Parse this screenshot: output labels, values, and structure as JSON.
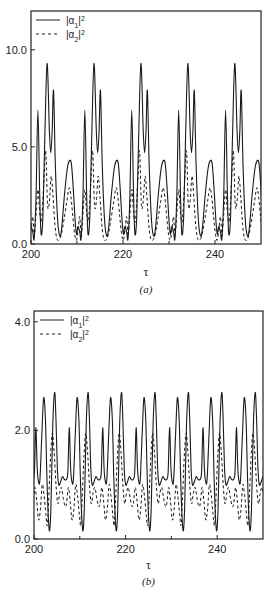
{
  "chart_data": [
    {
      "type": "line",
      "panel_label": "(a)",
      "title": "",
      "xlabel": "τ",
      "ylabel": "",
      "xlim": [
        200,
        250
      ],
      "ylim": [
        0,
        12
      ],
      "xticks": [
        200,
        220,
        240
      ],
      "xtick_labels": [
        "200",
        "220",
        "240"
      ],
      "xminor_ticks": [
        210,
        230
      ],
      "yticks": [
        0,
        5,
        10
      ],
      "ytick_labels": [
        "0.0",
        "5.0",
        "10.0"
      ],
      "grid": false,
      "legend": {
        "placement": "top-left",
        "entries": [
          {
            "label_base": "|α",
            "label_sub": "1",
            "label_post": "|",
            "label_sup": "2",
            "style": "solid"
          },
          {
            "label_base": "|α",
            "label_sub": "2",
            "label_post": "|",
            "label_sup": "2",
            "style": "dashed"
          }
        ]
      },
      "period": 10.2,
      "series": [
        {
          "name": "|α1|^2",
          "style": "solid",
          "period_template": [
            [
              0.0,
              0.6
            ],
            [
              0.3,
              0.3
            ],
            [
              0.7,
              2.5
            ],
            [
              1.1,
              6.9
            ],
            [
              1.5,
              2.5
            ],
            [
              1.8,
              0.5
            ],
            [
              2.2,
              1.5
            ],
            [
              2.6,
              5.5
            ],
            [
              3.1,
              9.3
            ],
            [
              3.6,
              5.8
            ],
            [
              3.9,
              4.7
            ],
            [
              4.2,
              5.8
            ],
            [
              4.5,
              7.9
            ],
            [
              4.9,
              4.0
            ],
            [
              5.4,
              1.2
            ],
            [
              5.9,
              0.4
            ],
            [
              6.3,
              0.9
            ],
            [
              6.9,
              2.6
            ],
            [
              7.5,
              3.9
            ],
            [
              8.0,
              4.3
            ],
            [
              8.4,
              4.1
            ],
            [
              8.8,
              2.8
            ],
            [
              9.2,
              1.2
            ],
            [
              9.5,
              0.5
            ],
            [
              9.8,
              0.9
            ],
            [
              10.2,
              0.6
            ]
          ],
          "phase_start": 200.4
        },
        {
          "name": "|α2|^2",
          "style": "dashed",
          "period_template": [
            [
              0.0,
              1.4
            ],
            [
              0.3,
              0.4
            ],
            [
              0.6,
              1.2
            ],
            [
              1.1,
              2.8
            ],
            [
              1.5,
              1.6
            ],
            [
              1.9,
              1.2
            ],
            [
              2.4,
              3.2
            ],
            [
              2.8,
              4.8
            ],
            [
              3.2,
              2.0
            ],
            [
              3.6,
              2.2
            ],
            [
              4.0,
              3.5
            ],
            [
              4.4,
              2.4
            ],
            [
              4.8,
              1.0
            ],
            [
              5.2,
              0.3
            ],
            [
              5.7,
              0.2
            ],
            [
              6.2,
              0.5
            ],
            [
              6.8,
              1.3
            ],
            [
              7.4,
              2.2
            ],
            [
              7.9,
              2.9
            ],
            [
              8.3,
              2.4
            ],
            [
              8.7,
              1.4
            ],
            [
              9.1,
              0.5
            ],
            [
              9.5,
              0.2
            ],
            [
              9.9,
              0.9
            ],
            [
              10.2,
              1.4
            ]
          ],
          "phase_start": 200.4
        }
      ]
    },
    {
      "type": "line",
      "panel_label": "(b)",
      "title": "",
      "xlabel": "τ",
      "ylabel": "",
      "xlim": [
        200,
        250
      ],
      "ylim": [
        0,
        4.2
      ],
      "xticks": [
        200,
        220,
        240
      ],
      "xtick_labels": [
        "200",
        "220",
        "240"
      ],
      "xminor_ticks": [
        210,
        230
      ],
      "yticks": [
        0,
        2,
        4
      ],
      "ytick_labels": [
        "0.0",
        "2.0",
        "4.0"
      ],
      "grid": false,
      "legend": {
        "placement": "top-left",
        "entries": [
          {
            "label_base": "|α",
            "label_sub": "1",
            "label_post": "|",
            "label_sup": "2",
            "style": "solid"
          },
          {
            "label_base": "|α",
            "label_sub": "2",
            "label_post": "|",
            "label_sup": "2",
            "style": "dashed"
          }
        ]
      },
      "period": 7.3,
      "series": [
        {
          "name": "|α1|^2",
          "style": "solid",
          "period_template": [
            [
              0.0,
              1.1
            ],
            [
              0.3,
              1.25
            ],
            [
              0.6,
              2.05
            ],
            [
              0.9,
              1.3
            ],
            [
              1.2,
              1.05
            ],
            [
              1.5,
              1.1
            ],
            [
              1.9,
              1.9
            ],
            [
              2.3,
              2.6
            ],
            [
              2.7,
              2.2
            ],
            [
              3.0,
              1.2
            ],
            [
              3.3,
              0.45
            ],
            [
              3.6,
              0.15
            ],
            [
              3.9,
              0.6
            ],
            [
              4.3,
              2.1
            ],
            [
              4.7,
              2.7
            ],
            [
              5.0,
              2.2
            ],
            [
              5.3,
              1.3
            ],
            [
              5.6,
              1.0
            ],
            [
              6.0,
              1.05
            ],
            [
              6.4,
              1.15
            ],
            [
              6.8,
              1.1
            ],
            [
              7.3,
              1.1
            ]
          ],
          "phase_start": 199.8
        },
        {
          "name": "|α2|^2",
          "style": "dashed",
          "period_template": [
            [
              0.0,
              0.65
            ],
            [
              0.4,
              0.95
            ],
            [
              0.8,
              0.7
            ],
            [
              1.2,
              0.35
            ],
            [
              1.6,
              0.55
            ],
            [
              2.0,
              1.0
            ],
            [
              2.4,
              0.8
            ],
            [
              2.8,
              0.45
            ],
            [
              3.1,
              0.25
            ],
            [
              3.4,
              0.7
            ],
            [
              3.8,
              1.5
            ],
            [
              4.2,
              1.95
            ],
            [
              4.6,
              1.6
            ],
            [
              5.0,
              1.0
            ],
            [
              5.4,
              0.65
            ],
            [
              5.8,
              0.85
            ],
            [
              6.2,
              0.95
            ],
            [
              6.6,
              0.75
            ],
            [
              7.0,
              0.6
            ],
            [
              7.3,
              0.65
            ]
          ],
          "phase_start": 199.8
        }
      ]
    }
  ]
}
